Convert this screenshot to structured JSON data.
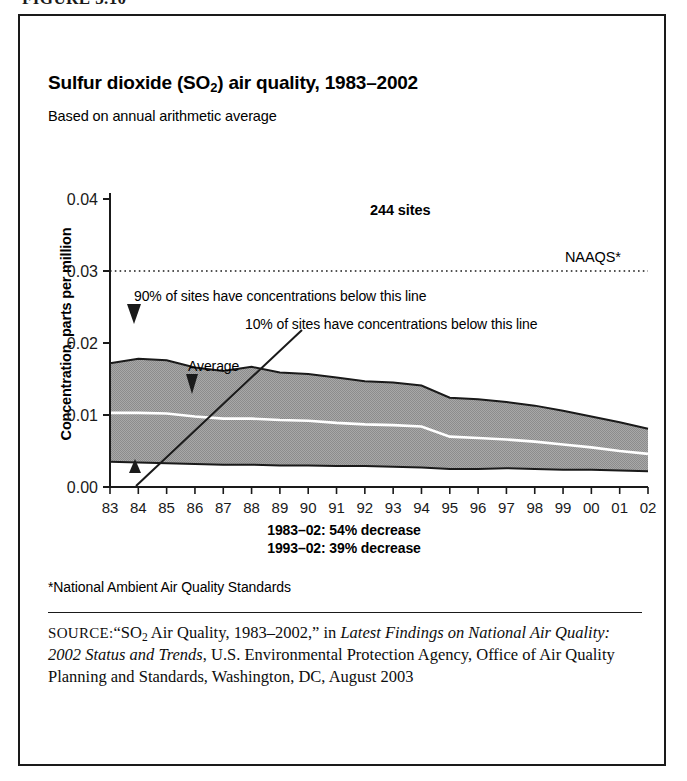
{
  "figure": {
    "number_label": "FIGURE 3.10"
  },
  "chart_header": {
    "title_prefix": "Sulfur dioxide (SO",
    "title_subscript": "2",
    "title_suffix": ") air quality, 1983–2002",
    "subtitle": "Based on annual arithmetic average"
  },
  "annotations": {
    "sites_count": "244 sites",
    "naaqs_label": "NAAQS*",
    "percentile_90": "90% of sites have concentrations below this line",
    "percentile_10": "10% of sites have concentrations below this line",
    "average_label": "Average",
    "decrease_line_1": "1983–02: 54% decrease",
    "decrease_line_2": "1993–02: 39% decrease"
  },
  "footnote": "*National Ambient Air Quality Standards",
  "source": {
    "label": "SOURCE:",
    "quote_open": "“SO",
    "quote_subscript": "2",
    "quote_rest": " Air Quality, 1983–2002,”",
    "connector": " in ",
    "italic_title": "Latest Findings on National Air Quality: 2002 Status and Trends",
    "tail": ", U.S. Environmental Protection Agency, Office of Air Quality Planning and Standards, Washington, DC, August 2003"
  },
  "colors": {
    "band_fill": "#9d9d9d",
    "band_outline": "#1a1a1a",
    "average_line": "#ffffff",
    "naaqs_line": "#1a1a1a",
    "axis": "#1a1a1a",
    "frame": "#1a1a1a"
  },
  "chart_data": {
    "type": "area",
    "title": "Sulfur dioxide (SO2) air quality, 1983–2002",
    "subtitle": "Based on annual arithmetic average",
    "xlabel": "",
    "ylabel": "Concentration, parts per million",
    "xlim": [
      1983,
      2002
    ],
    "ylim": [
      0.0,
      0.04
    ],
    "ytick_values": [
      0.0,
      0.01,
      0.02,
      0.03,
      0.04
    ],
    "ytick_labels": [
      "0.00",
      "0.01",
      "0.02",
      "0.03",
      "0.04"
    ],
    "grid": false,
    "legend": "annotations-inline",
    "x": [
      1983,
      1984,
      1985,
      1986,
      1987,
      1988,
      1989,
      1990,
      1991,
      1992,
      1993,
      1994,
      1995,
      1996,
      1997,
      1998,
      1999,
      2000,
      2001,
      2002
    ],
    "xtick_labels": [
      "83",
      "84",
      "85",
      "86",
      "87",
      "88",
      "89",
      "90",
      "91",
      "92",
      "93",
      "94",
      "95",
      "96",
      "97",
      "98",
      "99",
      "00",
      "01",
      "02"
    ],
    "series": [
      {
        "name": "90th percentile",
        "role": "band-upper",
        "values": [
          0.0172,
          0.0178,
          0.0176,
          0.0166,
          0.0161,
          0.0167,
          0.0159,
          0.0157,
          0.0152,
          0.0147,
          0.0145,
          0.0141,
          0.0124,
          0.0122,
          0.0118,
          0.0113,
          0.0106,
          0.0098,
          0.009,
          0.0081
        ]
      },
      {
        "name": "Average",
        "role": "center-line",
        "values": [
          0.0103,
          0.0103,
          0.0102,
          0.0098,
          0.0095,
          0.0095,
          0.0093,
          0.0092,
          0.0089,
          0.0087,
          0.0086,
          0.0084,
          0.007,
          0.0068,
          0.0066,
          0.0063,
          0.0059,
          0.0055,
          0.005,
          0.0046
        ]
      },
      {
        "name": "10th percentile",
        "role": "band-lower",
        "values": [
          0.0035,
          0.0034,
          0.0033,
          0.0032,
          0.0031,
          0.0031,
          0.003,
          0.003,
          0.0029,
          0.0029,
          0.0028,
          0.0027,
          0.0025,
          0.0025,
          0.0026,
          0.0025,
          0.0024,
          0.0024,
          0.0023,
          0.0022
        ]
      },
      {
        "name": "NAAQS*",
        "role": "threshold-line",
        "value": 0.03
      }
    ],
    "callouts": [
      {
        "text": "244 sites",
        "x": 1991,
        "y": 0.0375
      },
      {
        "text": "NAAQS*",
        "x": 2000.5,
        "y": 0.0322
      },
      {
        "text": "90% of sites have concentrations below this line",
        "points_to": {
          "x": 1984.6,
          "y": 0.0178
        }
      },
      {
        "text": "10% of sites have concentrations below this line",
        "points_to": {
          "x": 1984.4,
          "y": 0.0034
        }
      },
      {
        "text": "Average",
        "points_to": {
          "x": 1986.4,
          "y": 0.0097
        }
      }
    ],
    "summary": [
      "1983–02: 54% decrease",
      "1993–02: 39% decrease"
    ]
  }
}
